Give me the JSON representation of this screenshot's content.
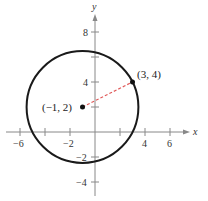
{
  "diagram": {
    "type": "coordinate-plane-circle",
    "axes": {
      "x_label": "x",
      "y_label": "y",
      "x_ticks": [
        "-6",
        "-2",
        "4",
        "6"
      ],
      "y_ticks": [
        "8",
        "4",
        "-2",
        "-4"
      ],
      "x_range": [
        -7,
        8
      ],
      "y_range": [
        -5,
        9
      ],
      "tick_step": 2
    },
    "circle": {
      "center": [
        -1,
        2
      ],
      "radius_squared": 20,
      "stroke": "#1a1a1a"
    },
    "points": [
      {
        "label": "(-1, 2)",
        "x": -1,
        "y": 2
      },
      {
        "label": "(3, 4)",
        "x": 3,
        "y": 4
      }
    ],
    "radius_segment": {
      "from": [
        -1,
        2
      ],
      "to": [
        3,
        4
      ],
      "color": "#e05a5a",
      "style": "dashed"
    },
    "labels": {
      "center_point": "(−1, 2)",
      "edge_point": "(3, 4)",
      "tick_x_neg6": "−6",
      "tick_x_neg2": "−2",
      "tick_x_4": "4",
      "tick_x_6": "6",
      "tick_y_8": "8",
      "tick_y_4": "4",
      "tick_y_neg2": "−2",
      "tick_y_neg4": "−4"
    }
  }
}
